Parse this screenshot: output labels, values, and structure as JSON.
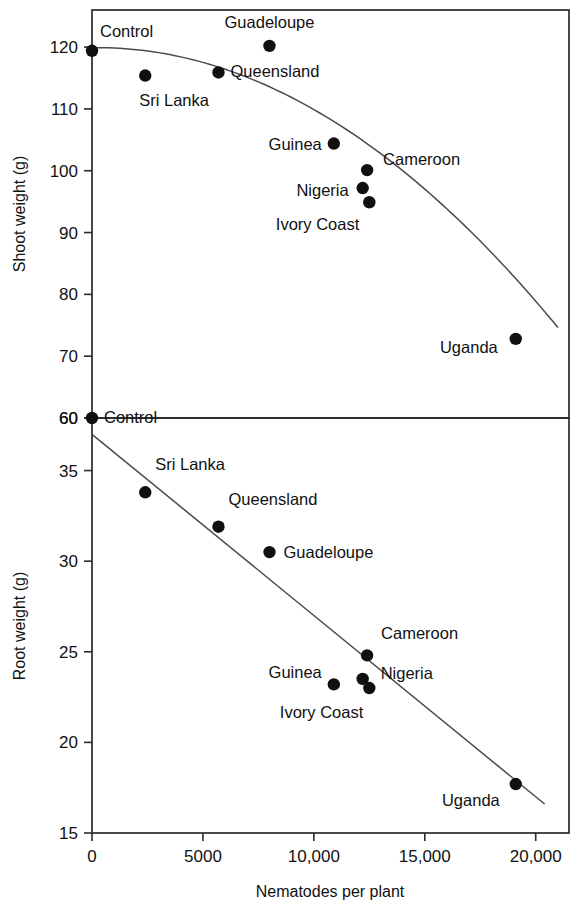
{
  "figure": {
    "background": "#ffffff",
    "marker_color": "#101010",
    "line_color": "#4a4a4a",
    "axis_color": "#2a2a2a"
  },
  "xaxis": {
    "label": "Nematodes per plant",
    "ticks": [
      "0",
      "5000",
      "10,000",
      "15,000",
      "20,000"
    ],
    "tick_values": [
      0,
      5000,
      10000,
      15000,
      20000
    ],
    "min": 0,
    "max": 21500
  },
  "panels": {
    "top": {
      "ylabel": "Shoot weight (g)",
      "ticks": [
        "120",
        "110",
        "100",
        "90",
        "80",
        "70",
        "60"
      ],
      "tick_values": [
        120,
        110,
        100,
        90,
        80,
        70,
        60
      ],
      "min": 60,
      "max": 126
    },
    "bottom": {
      "ylabel": "Root weight (g)",
      "ticks": [
        "60",
        "35",
        "30",
        "25",
        "20",
        "15"
      ],
      "tick_values": [
        35,
        30,
        25,
        20,
        15
      ],
      "top_boundary_tick": "60",
      "min": 15,
      "max": 37.9
    }
  },
  "chart_data": [
    {
      "type": "scatter",
      "title": "Shoot weight vs nematodes per plant",
      "panel": "top",
      "xlabel": "Nematodes per plant",
      "ylabel": "Shoot weight (g)",
      "xlim": [
        0,
        21500
      ],
      "ylim": [
        60,
        126
      ],
      "grid": false,
      "legend": false,
      "annotations": "each point labelled with its origin",
      "fit": "quadratic decreasing curve",
      "points": [
        {
          "label": "Control",
          "x": 0,
          "y": 119.4
        },
        {
          "label": "Sri Lanka",
          "x": 2400,
          "y": 115.4
        },
        {
          "label": "Queensland",
          "x": 5700,
          "y": 115.9
        },
        {
          "label": "Guadeloupe",
          "x": 8000,
          "y": 120.2
        },
        {
          "label": "Guinea",
          "x": 10900,
          "y": 104.4
        },
        {
          "label": "Cameroon",
          "x": 12400,
          "y": 100.1
        },
        {
          "label": "Nigeria",
          "x": 12200,
          "y": 97.2
        },
        {
          "label": "Ivory Coast",
          "x": 12500,
          "y": 94.9
        },
        {
          "label": "Uganda",
          "x": 19100,
          "y": 72.8
        }
      ]
    },
    {
      "type": "scatter",
      "title": "Root weight vs nematodes per plant",
      "panel": "bottom",
      "xlabel": "Nematodes per plant",
      "ylabel": "Root weight (g)",
      "xlim": [
        0,
        21500
      ],
      "ylim": [
        15,
        37.9
      ],
      "grid": false,
      "legend": false,
      "annotations": "each point labelled with its origin",
      "fit": "linear decreasing regression line",
      "points": [
        {
          "label": "Control",
          "x": 0,
          "y": 37.9
        },
        {
          "label": "Sri Lanka",
          "x": 2400,
          "y": 33.8
        },
        {
          "label": "Queensland",
          "x": 5700,
          "y": 31.9
        },
        {
          "label": "Guadeloupe",
          "x": 8000,
          "y": 30.5
        },
        {
          "label": "Guinea",
          "x": 10900,
          "y": 23.2
        },
        {
          "label": "Cameroon",
          "x": 12400,
          "y": 24.8
        },
        {
          "label": "Nigeria",
          "x": 12200,
          "y": 23.5
        },
        {
          "label": "Ivory Coast",
          "x": 12500,
          "y": 23.0
        },
        {
          "label": "Uganda",
          "x": 19100,
          "y": 17.7
        }
      ]
    }
  ],
  "point_labels": {
    "top": [
      {
        "name": "Control",
        "text": "Control"
      },
      {
        "name": "Sri Lanka",
        "text": "Sri Lanka"
      },
      {
        "name": "Queensland",
        "text": "Queensland"
      },
      {
        "name": "Guadeloupe",
        "text": "Guadeloupe"
      },
      {
        "name": "Guinea",
        "text": "Guinea"
      },
      {
        "name": "Cameroon",
        "text": "Cameroon"
      },
      {
        "name": "Nigeria",
        "text": "Nigeria"
      },
      {
        "name": "Ivory Coast",
        "text": "Ivory Coast"
      },
      {
        "name": "Uganda",
        "text": "Uganda"
      }
    ],
    "bottom": [
      {
        "name": "Control",
        "text": "Control"
      },
      {
        "name": "Sri Lanka",
        "text": "Sri Lanka"
      },
      {
        "name": "Queensland",
        "text": "Queensland"
      },
      {
        "name": "Guadeloupe",
        "text": "Guadeloupe"
      },
      {
        "name": "Guinea",
        "text": "Guinea"
      },
      {
        "name": "Cameroon",
        "text": "Cameroon"
      },
      {
        "name": "Nigeria",
        "text": "Nigeria"
      },
      {
        "name": "Ivory Coast",
        "text": "Ivory Coast"
      },
      {
        "name": "Uganda",
        "text": "Uganda"
      }
    ]
  }
}
